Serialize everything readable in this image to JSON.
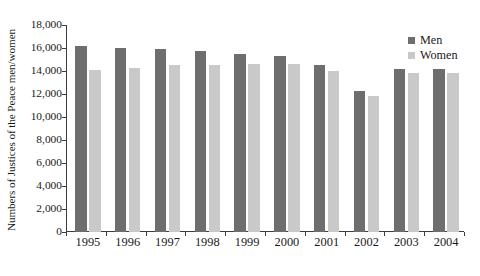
{
  "chart_data": {
    "type": "bar",
    "title": "",
    "subtitle": "",
    "xlabel": "",
    "ylabel": "Numbers of Justices of the Peace men/women",
    "categories": [
      "1995",
      "1996",
      "1997",
      "1998",
      "1999",
      "2000",
      "2001",
      "2002",
      "2003",
      "2004"
    ],
    "series": [
      {
        "name": "Men",
        "color": "#6e6e6e",
        "values": [
          16200,
          16000,
          15900,
          15700,
          15500,
          15300,
          14500,
          12300,
          14200,
          14200
        ]
      },
      {
        "name": "Women",
        "color": "#c9c9c9",
        "values": [
          14100,
          14300,
          14500,
          14500,
          14600,
          14600,
          14000,
          11800,
          13800,
          13800
        ]
      }
    ],
    "ylim": [
      0,
      18000
    ],
    "ytick_values": [
      0,
      2000,
      4000,
      6000,
      8000,
      10000,
      12000,
      14000,
      16000,
      18000
    ],
    "ytick_labels": [
      "0",
      "2,000",
      "4,000",
      "6,000",
      "8,000",
      "10,000",
      "12,000",
      "14,000",
      "16,000",
      "18,000"
    ],
    "grid": false,
    "legend_position": "top-right",
    "orientation": "vertical"
  },
  "legend": {
    "entries": [
      {
        "label": "Men",
        "color": "#6e6e6e"
      },
      {
        "label": "Women",
        "color": "#c9c9c9"
      }
    ]
  },
  "axes": {
    "y_title": "Numbers of Justices of the Peace men/women"
  }
}
